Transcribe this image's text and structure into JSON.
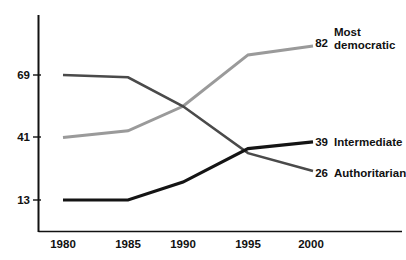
{
  "chart_data": {
    "type": "line",
    "title": "",
    "subtitle": "",
    "xlabel": "",
    "ylabel": "",
    "x": [
      1980,
      1985,
      1990,
      1995,
      2000
    ],
    "categories": [
      "1980",
      "1985",
      "1990",
      "1995",
      "2000"
    ],
    "xtick_labels": [
      "1980",
      "1985",
      "1990",
      "1995",
      "2000"
    ],
    "ytick_labels": [
      "69",
      "41",
      "13"
    ],
    "ytick_values": [
      69,
      41,
      13
    ],
    "ylim": [
      4,
      92
    ],
    "xlim": [
      1980,
      2000
    ],
    "grid": false,
    "legend_position": "right-of-line-ends",
    "series": [
      {
        "name": "Most democratic",
        "legend_label": "Most democratic",
        "legend_line1": "Most",
        "legend_line2": "democratic",
        "end_value_label": "82",
        "color": "#9a9a9a",
        "values": [
          41,
          44,
          55,
          78,
          82
        ]
      },
      {
        "name": "Intermediate",
        "legend_label": "Intermediate",
        "legend_line1": "Intermediate",
        "legend_line2": "",
        "end_value_label": "39",
        "color": "#141414",
        "values": [
          13,
          13,
          21,
          36,
          39
        ]
      },
      {
        "name": "Authoritarian",
        "legend_label": "Authoritarian",
        "legend_line1": "Authoritarian",
        "legend_line2": "",
        "end_value_label": "26",
        "color": "#4a4a4a",
        "values": [
          69,
          68,
          55,
          34,
          26
        ]
      }
    ]
  }
}
